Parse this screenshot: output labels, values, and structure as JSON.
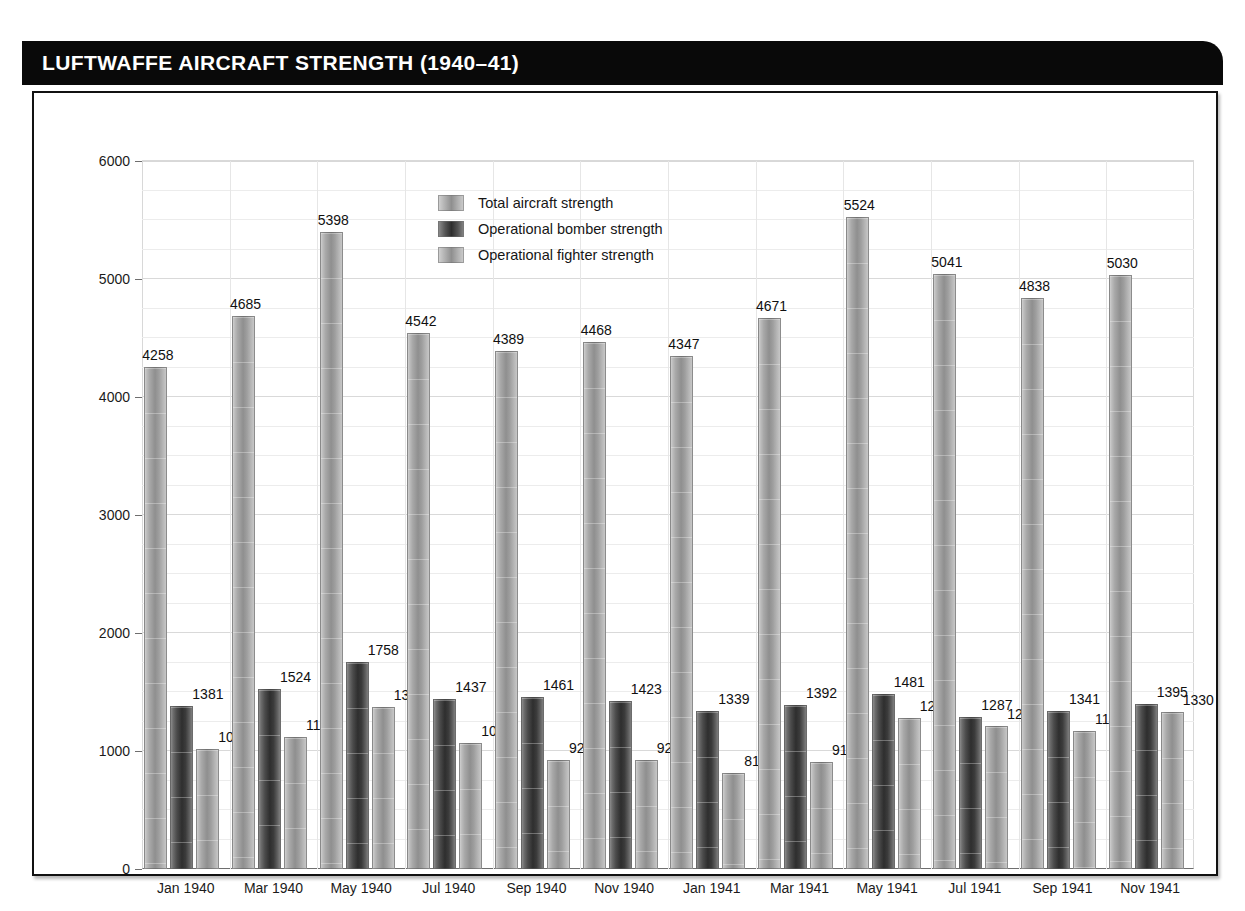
{
  "header": {
    "title": "LUFTWAFFE AIRCRAFT STRENGTH (1940–41)"
  },
  "legend": {
    "items": [
      {
        "label": "Total aircraft strength",
        "swatch": "total",
        "color": "#9a9a9a"
      },
      {
        "label": "Operational bomber strength",
        "swatch": "bomber",
        "color": "#333333"
      },
      {
        "label": "Operational fighter strength",
        "swatch": "fighter",
        "color": "#9a9a9a"
      }
    ]
  },
  "chart_data": {
    "type": "bar",
    "title": "LUFTWAFFE AIRCRAFT STRENGTH (1940–41)",
    "xlabel": "",
    "ylabel": "",
    "ylim": [
      0,
      6000
    ],
    "yticks": [
      0,
      1000,
      2000,
      3000,
      4000,
      5000,
      6000
    ],
    "ytick_labels": [
      "0",
      "1000",
      "2000",
      "3000",
      "4000",
      "5000",
      "6000"
    ],
    "minor_tick_step": 250,
    "grid": true,
    "legend_position": "top-center",
    "categories": [
      "Jan 1940",
      "Mar 1940",
      "May 1940",
      "Jul 1940",
      "Sep 1940",
      "Nov 1940",
      "Jan 1941",
      "Mar 1941",
      "May 1941",
      "Jul 1941",
      "Sep 1941",
      "Nov 1941"
    ],
    "series": [
      {
        "name": "Total aircraft strength",
        "values": [
          4258,
          4685,
          5398,
          4542,
          4389,
          4468,
          4347,
          4671,
          5524,
          5041,
          4838,
          5030
        ]
      },
      {
        "name": "Operational bomber strength",
        "values": [
          1381,
          1524,
          1758,
          1437,
          1461,
          1423,
          1339,
          1392,
          1481,
          1287,
          1341,
          1395
        ]
      },
      {
        "name": "Operational fighter strength",
        "values": [
          1016,
          1123,
          1369,
          1071,
          921,
          921,
          817,
          910,
          1277,
          1213,
          1171,
          1330
        ]
      }
    ]
  }
}
